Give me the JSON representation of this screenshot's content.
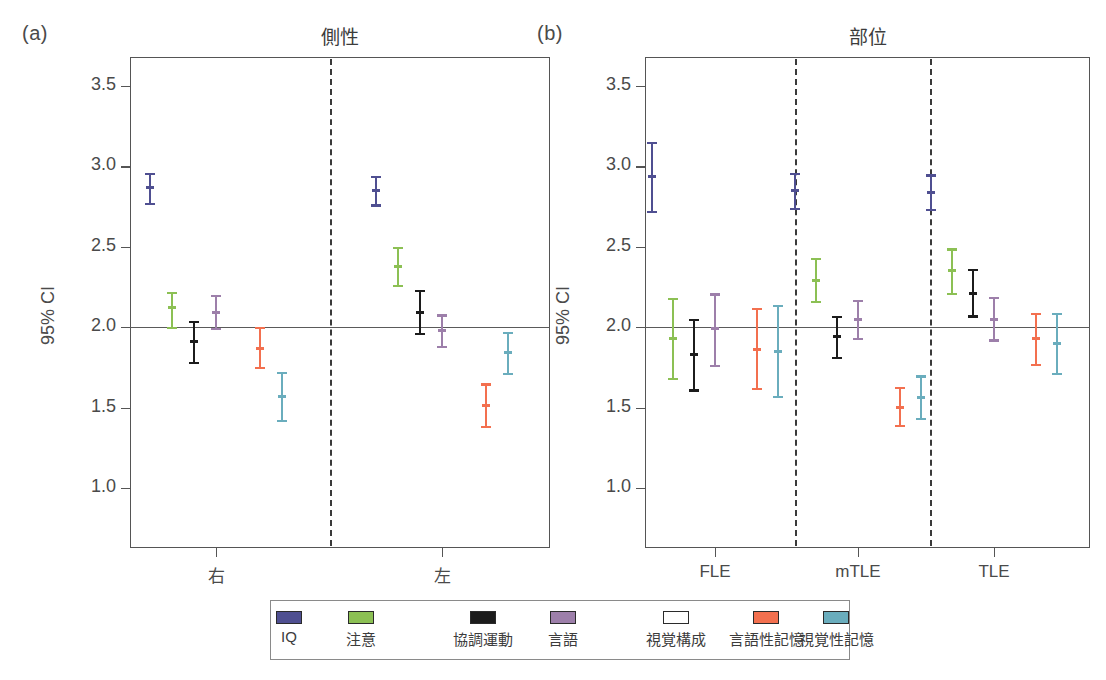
{
  "figure": {
    "caption": ""
  },
  "axis": {
    "ylabel": "95% CI",
    "yticks": [
      "3.5",
      "3.0",
      "2.5",
      "2.0",
      "1.5",
      "1.0"
    ],
    "ytick_values": [
      3.5,
      3.0,
      2.5,
      2.0,
      1.5,
      1.0
    ],
    "ylim": [
      0.82,
      3.62
    ],
    "refline_value": 2.0
  },
  "panels": [
    {
      "tag": "(a)",
      "title": "側性"
    },
    {
      "tag": "(b)",
      "title": "部位"
    }
  ],
  "legend": {
    "items": [
      {
        "label": "IQ",
        "color": "#4f4f91"
      },
      {
        "label": "注意",
        "color": "#8cc054"
      },
      {
        "label": "協調運動",
        "color": "#1c1c1c"
      },
      {
        "label": "言語",
        "color": "#9d7faa"
      },
      {
        "label": "視覚構成",
        "color": "#f9a council"
      },
      {
        "label": "言語性記憶",
        "color": "#f3704f"
      },
      {
        "label": "視覚性記憶",
        "color": "#6aadbd"
      }
    ]
  },
  "chart_data": {
    "type": "scatter",
    "ylabel": "95% CI",
    "ylim": [
      0.82,
      3.62
    ],
    "yticks": [
      3.5,
      3.0,
      2.5,
      2.0,
      1.5,
      1.0
    ],
    "grid": false,
    "legend_position": "bottom",
    "reference_line": 2.0,
    "series_names": [
      "IQ",
      "注意",
      "協調運動",
      "言語",
      "視覚構成",
      "言語性記憶",
      "視覚性記憶"
    ],
    "series_colors": [
      "#4f4f91",
      "#8cc054",
      "#1c1c1c",
      "#9d7faa",
      "#f9a council",
      "#f3704f",
      "#6aadbd"
    ],
    "panels": [
      {
        "tag": "(a)",
        "title": "側性",
        "categories": [
          "右",
          "左"
        ],
        "groups": [
          {
            "category": "右",
            "points": [
              {
                "series": "IQ",
                "mean": 2.87,
                "low": 2.76,
                "high": 2.96
              },
              {
                "series": "注意",
                "mean": 2.12,
                "low": 1.99,
                "high": 2.22
              },
              {
                "series": "協調運動",
                "mean": 1.91,
                "low": 1.77,
                "high": 2.04
              },
              {
                "series": "言語",
                "mean": 2.09,
                "low": 1.98,
                "high": 2.2
              },
              {
                "series": "視覚構成",
                "mean": 2.3,
                "low": 2.16,
                "high": 2.45
              },
              {
                "series": "言語性記憶",
                "mean": 1.87,
                "low": 1.74,
                "high": 2.0
              },
              {
                "series": "視覚性記憶",
                "mean": 1.57,
                "low": 1.41,
                "high": 1.72
              }
            ]
          },
          {
            "category": "左",
            "points": [
              {
                "series": "IQ",
                "mean": 2.85,
                "low": 2.75,
                "high": 2.94
              },
              {
                "series": "注意",
                "mean": 2.38,
                "low": 2.25,
                "high": 2.5
              },
              {
                "series": "協調運動",
                "mean": 2.09,
                "low": 1.95,
                "high": 2.23
              },
              {
                "series": "言語",
                "mean": 1.98,
                "low": 1.87,
                "high": 2.08
              },
              {
                "series": "視覚構成",
                "mean": 2.38,
                "low": 2.24,
                "high": 2.51
              },
              {
                "series": "言語性記憶",
                "mean": 1.51,
                "low": 1.37,
                "high": 1.65
              },
              {
                "series": "視覚性記憶",
                "mean": 1.84,
                "low": 1.7,
                "high": 1.97
              }
            ]
          }
        ]
      },
      {
        "tag": "(b)",
        "title": "部位",
        "categories": [
          "FLE",
          "mTLE",
          "TLE"
        ],
        "groups": [
          {
            "category": "FLE",
            "points": [
              {
                "series": "IQ",
                "mean": 2.94,
                "low": 2.71,
                "high": 3.15
              },
              {
                "series": "注意",
                "mean": 1.93,
                "low": 1.67,
                "high": 2.18
              },
              {
                "series": "協調運動",
                "mean": 1.83,
                "low": 1.6,
                "high": 2.05
              },
              {
                "series": "言語",
                "mean": 1.99,
                "low": 1.75,
                "high": 2.21
              },
              {
                "series": "視覚構成",
                "mean": 2.25,
                "low": 1.99,
                "high": 2.5
              },
              {
                "series": "言語性記憶",
                "mean": 1.86,
                "low": 1.61,
                "high": 2.12
              },
              {
                "series": "視覚性記憶",
                "mean": 1.85,
                "low": 1.56,
                "high": 2.14
              }
            ]
          },
          {
            "category": "mTLE",
            "points": [
              {
                "series": "IQ",
                "mean": 2.85,
                "low": 2.73,
                "high": 2.96
              },
              {
                "series": "注意",
                "mean": 2.29,
                "low": 2.15,
                "high": 2.43
              },
              {
                "series": "協調運動",
                "mean": 1.94,
                "low": 1.8,
                "high": 2.07
              },
              {
                "series": "言語",
                "mean": 2.05,
                "low": 1.92,
                "high": 2.17
              },
              {
                "series": "視覚構成",
                "mean": 2.29,
                "low": 2.16,
                "high": 2.43
              },
              {
                "series": "言語性記憶",
                "mean": 1.5,
                "low": 1.38,
                "high": 1.63
              },
              {
                "series": "視覚性記憶",
                "mean": 1.56,
                "low": 1.42,
                "high": 1.7
              }
            ]
          },
          {
            "category": "TLE",
            "points": [
              {
                "series": "IQ",
                "mean": 2.84,
                "low": 2.72,
                "high": 2.95
              },
              {
                "series": "注意",
                "mean": 2.35,
                "low": 2.2,
                "high": 2.49
              },
              {
                "series": "協調運動",
                "mean": 2.21,
                "low": 2.06,
                "high": 2.36
              },
              {
                "series": "言語",
                "mean": 2.05,
                "low": 1.91,
                "high": 2.19
              },
              {
                "series": "視覚構成",
                "mean": 2.48,
                "low": 2.32,
                "high": 2.63
              },
              {
                "series": "言語性記憶",
                "mean": 1.93,
                "low": 1.76,
                "high": 2.09
              },
              {
                "series": "視覚性記憶",
                "mean": 1.9,
                "low": 1.7,
                "high": 2.09
              }
            ]
          }
        ]
      }
    ]
  },
  "geometry": {
    "panel_a": {
      "left": 130,
      "right": 550,
      "dividers": [
        330
      ],
      "group_x": [
        216,
        442
      ]
    },
    "panel_b": {
      "left": 645,
      "right": 1090,
      "dividers": [
        795,
        930
      ],
      "group_x": [
        715,
        858,
        994
      ]
    },
    "plot_top": 57,
    "plot_bottom": 548,
    "y_of_3_5": 86,
    "y_of_1_0": 488,
    "legend_box": {
      "left": 270,
      "top": 600,
      "width": 580,
      "height": 60
    },
    "legend_x": [
      288,
      360,
      482,
      562,
      675,
      765,
      835
    ]
  }
}
